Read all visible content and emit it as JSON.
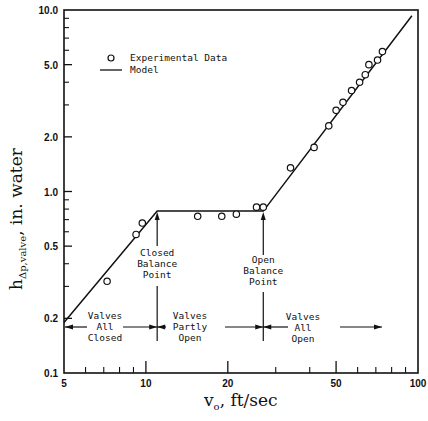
{
  "chart_data": {
    "type": "scatter",
    "title": "",
    "xlabel": "v_o , ft/sec",
    "ylabel": "h_Δp,valve , in. water",
    "xscale": "log",
    "yscale": "log",
    "xlim": [
      5,
      100
    ],
    "ylim": [
      0.1,
      10.0
    ],
    "grid": false,
    "x_ticks": [
      "5",
      "10",
      "20",
      "50",
      "100"
    ],
    "y_ticks": [
      "0.1",
      "0.2",
      "0.5",
      "1.0",
      "2.0",
      "5.0",
      "10.0"
    ],
    "legend": {
      "position": "upper-left",
      "entries": [
        {
          "marker": "open-circle",
          "label": "Experimental Data"
        },
        {
          "marker": "line",
          "label": "Model"
        }
      ]
    },
    "series": [
      {
        "name": "Experimental Data",
        "type": "scatter",
        "points": [
          {
            "x": 7.2,
            "y": 0.32
          },
          {
            "x": 9.2,
            "y": 0.58
          },
          {
            "x": 9.7,
            "y": 0.67
          },
          {
            "x": 15.5,
            "y": 0.73
          },
          {
            "x": 19.0,
            "y": 0.73
          },
          {
            "x": 21.5,
            "y": 0.75
          },
          {
            "x": 25.5,
            "y": 0.82
          },
          {
            "x": 27.0,
            "y": 0.82
          },
          {
            "x": 34.0,
            "y": 1.35
          },
          {
            "x": 41.5,
            "y": 1.75
          },
          {
            "x": 47.0,
            "y": 2.3
          },
          {
            "x": 50.0,
            "y": 2.8
          },
          {
            "x": 53.0,
            "y": 3.1
          },
          {
            "x": 57.0,
            "y": 3.6
          },
          {
            "x": 61.0,
            "y": 4.0
          },
          {
            "x": 64.0,
            "y": 4.4
          },
          {
            "x": 66.0,
            "y": 5.0
          },
          {
            "x": 71.0,
            "y": 5.3
          },
          {
            "x": 74.0,
            "y": 5.9
          }
        ]
      },
      {
        "name": "Model",
        "type": "line",
        "points": [
          {
            "x": 5.0,
            "y": 0.19
          },
          {
            "x": 11.0,
            "y": 0.78
          },
          {
            "x": 27.0,
            "y": 0.78
          },
          {
            "x": 95.0,
            "y": 9.3
          }
        ]
      }
    ],
    "annotations": [
      {
        "text": [
          "Closed",
          "Balance",
          "Point"
        ],
        "x": 11.0
      },
      {
        "text": [
          "Open",
          "Balance",
          "Point"
        ],
        "x": 27.0
      },
      {
        "text": [
          "Valves",
          "All",
          "Closed"
        ],
        "region": [
          5,
          11
        ]
      },
      {
        "text": [
          "Valves",
          "Partly",
          "Open"
        ],
        "region": [
          11,
          27
        ]
      },
      {
        "text": [
          "Valves",
          "All",
          "Open"
        ],
        "region": [
          27,
          100
        ]
      }
    ]
  },
  "labels": {
    "y_title_main": "h",
    "y_title_sub": "Δp,valve",
    "y_title_rest": ",   in. water",
    "x_title_main": "v",
    "x_title_sub": "o",
    "x_title_rest": ",    ft/sec",
    "legend_data": "Experimental Data",
    "legend_model": "Model",
    "closed_bp": [
      "Closed",
      "Balance",
      "Point"
    ],
    "open_bp": [
      "Open",
      "Balance",
      "Point"
    ],
    "all_closed": [
      "Valves",
      "All",
      "Closed"
    ],
    "partly_open": [
      "Valves",
      "Partly",
      "Open"
    ],
    "all_open": [
      "Valves",
      "All",
      "Open"
    ]
  }
}
